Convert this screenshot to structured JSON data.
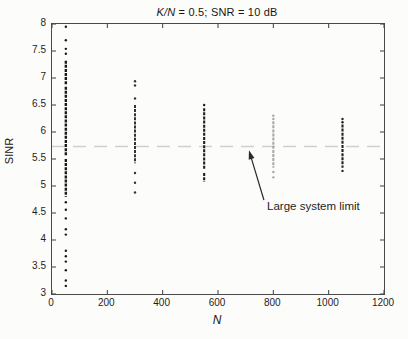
{
  "figure": {
    "bg": "#fcfcfa",
    "title_italic": "K/N",
    "title_rest": " = 0.5; SNR = 10 dB",
    "xlabel": "N",
    "ylabel": "SINR",
    "annotation_text": "Large system limit"
  },
  "chart_data": {
    "type": "scatter",
    "title": "K/N = 0.5; SNR = 10 dB",
    "xlabel": "N",
    "ylabel": "SINR",
    "xlim": [
      0,
      1200
    ],
    "ylim": [
      3,
      8
    ],
    "x_ticks": [
      0,
      200,
      400,
      600,
      800,
      1000,
      1200
    ],
    "y_ticks": [
      3,
      3.5,
      4,
      4.5,
      5,
      5.5,
      6,
      6.5,
      7,
      7.5,
      8
    ],
    "grid": false,
    "box": true,
    "tick_color": "#3d3d3d",
    "reference_line": {
      "meaning": "large system limit",
      "value": 5.73,
      "style": "dashed",
      "color": "#cfcfcc"
    },
    "annotation": {
      "text": "Large system limit",
      "text_xy": [
        781,
        4.73
      ],
      "arrow_tail": [
        766,
        4.74
      ],
      "arrow_tip": [
        712,
        5.66
      ],
      "arrow_color": "#2a2a2a"
    },
    "series": [
      {
        "name": "empirical SINR, N = 50",
        "N": 50,
        "color": "#1a1a1a",
        "line_width": 2.4,
        "dense_segments": [
          [
            6.88,
            7.32
          ],
          [
            5.56,
            6.84
          ],
          [
            4.8,
            5.5
          ]
        ],
        "points": [
          7.95,
          7.7,
          7.54,
          7.45,
          4.7,
          4.56,
          4.4,
          4.2,
          4.1,
          3.8,
          3.7,
          3.6,
          3.44,
          3.25,
          3.15
        ]
      },
      {
        "name": "empirical SINR, N = 300",
        "N": 300,
        "color": "#333333",
        "line_width": 2,
        "dense_segments": [
          [
            5.42,
            6.5
          ]
        ],
        "points": [
          6.94,
          6.86,
          6.62,
          5.24,
          5.06,
          4.88
        ]
      },
      {
        "name": "empirical SINR, N = 550",
        "N": 550,
        "color": "#1e1e1e",
        "line_width": 2.1,
        "dense_segments": [
          [
            5.3,
            6.44
          ],
          [
            5.08,
            5.24
          ]
        ],
        "points": [
          6.5
        ]
      },
      {
        "name": "empirical SINR, N = 800",
        "N": 800,
        "color": "#a6a6a6",
        "line_width": 2,
        "dense_segments": [
          [
            5.34,
            6.2
          ]
        ],
        "points": [
          6.3,
          6.24,
          5.26,
          5.16
        ]
      },
      {
        "name": "empirical SINR, N = 1050",
        "N": 1050,
        "color": "#202020",
        "line_width": 2.1,
        "dense_segments": [
          [
            5.34,
            6.14
          ]
        ],
        "points": [
          6.24,
          6.18,
          5.28
        ]
      }
    ]
  }
}
